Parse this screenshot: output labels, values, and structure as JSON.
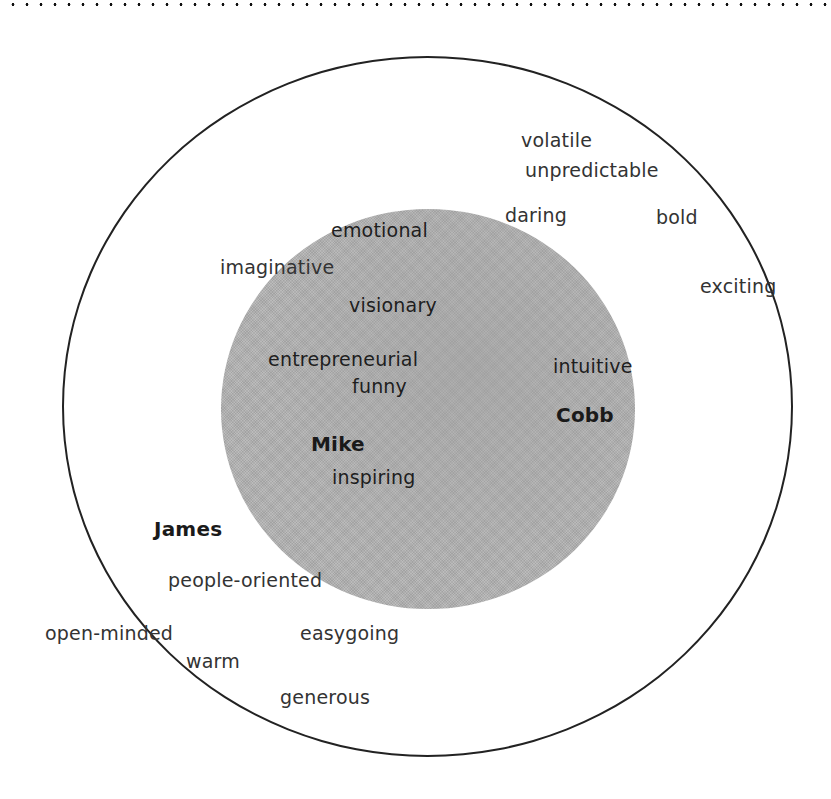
{
  "diagram": {
    "type": "concentric-trait-map",
    "colors": {
      "background": "#ffffff",
      "outer_circle_stroke": "#222222",
      "inner_circle_fill": "#b4b4b4",
      "text": "#333333",
      "name_text": "#1a1a1a"
    },
    "outer_circle": {
      "label": "",
      "words": {
        "volatile": "volatile",
        "unpredictable": "unpredictable",
        "daring": "daring",
        "bold": "bold",
        "exciting": "exciting",
        "imaginative": "imaginative",
        "james": "James",
        "people_oriented": "people-oriented",
        "open_minded": "open-minded",
        "warm": "warm",
        "easygoing": "easygoing",
        "generous": "generous"
      }
    },
    "inner_circle": {
      "label": "",
      "words": {
        "emotional": "emotional",
        "visionary": "visionary",
        "entrepreneurial": "entrepreneurial",
        "funny": "funny",
        "intuitive": "intuitive",
        "cobb": "Cobb",
        "mike": "Mike",
        "inspiring": "inspiring"
      }
    },
    "names": [
      "Mike",
      "Cobb",
      "James"
    ]
  }
}
